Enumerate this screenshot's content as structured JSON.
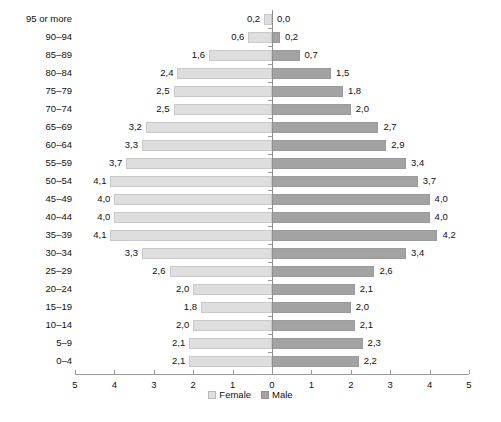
{
  "chart_data": {
    "type": "bar",
    "subtype": "population-pyramid",
    "title": "",
    "xlabel": "",
    "ylabel": "",
    "xlim": [
      0,
      5
    ],
    "grid": false,
    "legend_position": "bottom-center",
    "decimal_separator": ",",
    "categories": [
      "95 or more",
      "90–94",
      "85–89",
      "80–84",
      "75–79",
      "70–74",
      "65–69",
      "60–64",
      "55–59",
      "50–54",
      "45–49",
      "40–44",
      "35–39",
      "30–34",
      "25–29",
      "20–24",
      "15–19",
      "10–14",
      "5–9",
      "0–4"
    ],
    "series": [
      {
        "name": "Female",
        "side": "left",
        "color": "#dedede",
        "values": [
          0.2,
          0.6,
          1.6,
          2.4,
          2.5,
          2.5,
          3.2,
          3.3,
          3.7,
          4.1,
          4.0,
          4.0,
          4.1,
          3.3,
          2.6,
          2.0,
          1.8,
          2.0,
          2.1,
          2.1
        ],
        "labels": [
          "0,2",
          "0,6",
          "1,6",
          "2,4",
          "2,5",
          "2,5",
          "3,2",
          "3,3",
          "3,7",
          "4,1",
          "4,0",
          "4,0",
          "4,1",
          "3,3",
          "2,6",
          "2,0",
          "1,8",
          "2,0",
          "2,1",
          "2,1"
        ]
      },
      {
        "name": "Male",
        "side": "right",
        "color": "#a3a3a3",
        "values": [
          0.0,
          0.2,
          0.7,
          1.5,
          1.8,
          2.0,
          2.7,
          2.9,
          3.4,
          3.7,
          4.0,
          4.0,
          4.2,
          3.4,
          2.6,
          2.1,
          2.0,
          2.1,
          2.3,
          2.2
        ],
        "labels": [
          "0,0",
          "0,2",
          "0,7",
          "1,5",
          "1,8",
          "2,0",
          "2,7",
          "2,9",
          "3,4",
          "3,7",
          "4,0",
          "4,0",
          "4,2",
          "3,4",
          "2,6",
          "2,1",
          "2,0",
          "2,1",
          "2,3",
          "2,2"
        ]
      }
    ],
    "axis_ticks_left": [
      "5",
      "4",
      "3",
      "2",
      "1",
      "0"
    ],
    "axis_ticks_right": [
      "1",
      "2",
      "3",
      "4",
      "5"
    ]
  },
  "legend": {
    "items": [
      {
        "label": "Female",
        "swatch": "legend-swatch-female"
      },
      {
        "label": "Male",
        "swatch": "legend-swatch-male"
      }
    ]
  },
  "caption": {
    "text": ""
  }
}
